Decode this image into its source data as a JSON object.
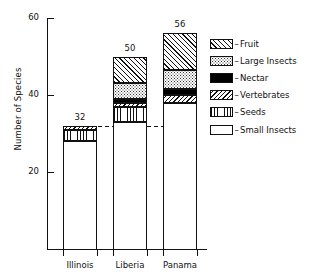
{
  "chart_data": {
    "type": "bar",
    "subtype": "stacked-bar",
    "title": "",
    "xlabel": "",
    "ylabel": "Number of Species",
    "categories": [
      "Illinois",
      "Liberia",
      "Panama"
    ],
    "ylim": [
      0,
      62
    ],
    "yticks": [
      20,
      40,
      60
    ],
    "ytick_labels": [
      "20",
      "40",
      "60"
    ],
    "grid": false,
    "legend_position": "right",
    "totals": [
      32,
      50,
      56
    ],
    "total_labels": [
      "32",
      "50",
      "56"
    ],
    "reference_line": {
      "value": 32,
      "style": "dashed",
      "label": ""
    },
    "series": [
      {
        "name": "Small Insects",
        "pattern": "pat-small-insects",
        "values": [
          28,
          33,
          38
        ]
      },
      {
        "name": "Seeds",
        "pattern": "pat-seeds",
        "values": [
          3,
          4,
          0
        ]
      },
      {
        "name": "Vertebrates",
        "pattern": "pat-vertebrates",
        "values": [
          1,
          1,
          2
        ]
      },
      {
        "name": "Nectar",
        "pattern": "pat-nectar",
        "values": [
          0,
          1,
          1.5
        ]
      },
      {
        "name": "Large Insects",
        "pattern": "pat-large-insects",
        "values": [
          0,
          4,
          5
        ]
      },
      {
        "name": "Fruit",
        "pattern": "pat-fruit",
        "values": [
          0,
          7,
          9.5
        ]
      }
    ]
  },
  "legend": {
    "dash": "–",
    "entries": [
      {
        "label": "Fruit",
        "pattern": "pat-fruit"
      },
      {
        "label": "Large Insects",
        "pattern": "pat-large-insects"
      },
      {
        "label": "Nectar",
        "pattern": "pat-nectar"
      },
      {
        "label": "Vertebrates",
        "pattern": "pat-vertebrates"
      },
      {
        "label": "Seeds",
        "pattern": "pat-seeds"
      },
      {
        "label": "Small Insects",
        "pattern": "pat-small-insects"
      }
    ]
  },
  "axes": {
    "y_title": "Number of Species"
  },
  "colors": {
    "ink": "#111111",
    "background": "#ffffff",
    "nectar": "#000000"
  }
}
